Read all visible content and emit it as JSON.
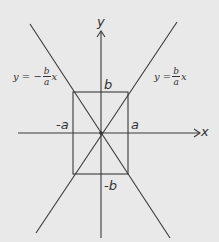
{
  "diagram": {
    "axes": {
      "x_label": "x",
      "y_label": "y"
    },
    "rectangle_labels": {
      "top": "b",
      "bottom": "-b",
      "left": "-a",
      "right": "a"
    },
    "asymptotes": {
      "negative": {
        "lhs": "y = −",
        "num": "b",
        "den": "a",
        "var": "x"
      },
      "positive": {
        "lhs": "y = ",
        "num": "b",
        "den": "a",
        "var": "x"
      }
    },
    "colors": {
      "background": "#e9e9e9",
      "ink": "#333333"
    }
  }
}
